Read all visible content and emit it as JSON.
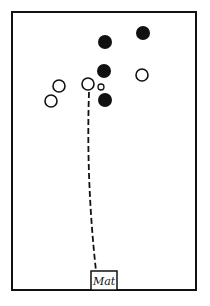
{
  "diagram": {
    "type": "court-positions",
    "colors": {
      "stroke": "#111111",
      "filled": "#111111",
      "background": "#ffffff"
    },
    "court": {
      "x": 12,
      "y": 12,
      "width": 184,
      "height": 278
    },
    "filled_players": [
      {
        "id": "f1",
        "cx": 105,
        "cy": 42,
        "r": 7
      },
      {
        "id": "f2",
        "cx": 143,
        "cy": 33,
        "r": 7
      },
      {
        "id": "f3",
        "cx": 104,
        "cy": 71,
        "r": 7
      },
      {
        "id": "f4",
        "cx": 105,
        "cy": 100,
        "r": 7
      }
    ],
    "open_players": [
      {
        "id": "o1",
        "cx": 59,
        "cy": 86,
        "r": 6
      },
      {
        "id": "o2",
        "cx": 51,
        "cy": 101,
        "r": 6
      },
      {
        "id": "o3",
        "cx": 88,
        "cy": 84,
        "r": 6
      },
      {
        "id": "o4",
        "cx": 142,
        "cy": 75,
        "r": 6
      }
    ],
    "ball": {
      "cx": 101,
      "cy": 87,
      "r": 3
    },
    "path": {
      "from": [
        89,
        92
      ],
      "control": [
        86,
        180
      ],
      "to": [
        96,
        271
      ],
      "style": "dashed"
    },
    "mat": {
      "label": "Mat",
      "x": 91,
      "y": 271,
      "width": 26,
      "height": 19
    }
  }
}
